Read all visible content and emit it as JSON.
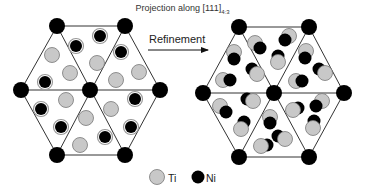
{
  "title": {
    "text": "Projection along [111]",
    "subscript": "4:3"
  },
  "arrow": {
    "label": "Refinement",
    "x1": 148,
    "y1": 50,
    "x2": 208,
    "y2": 50
  },
  "legend": {
    "items": [
      {
        "label": "Ti",
        "type": "Ti",
        "cx": 157,
        "cy": 177,
        "text_x": 168
      },
      {
        "label": "Ni",
        "type": "Ni",
        "cx": 198,
        "cy": 177,
        "text_x": 206
      }
    ]
  },
  "colors": {
    "ti_fill": "#c8c8c8",
    "ti_stroke": "#777777",
    "ni_fill": "#000000",
    "ni_ring": "#999999",
    "line": "#333333",
    "vertex": "#000000"
  },
  "panels": [
    {
      "name": "before-refinement",
      "center": [
        90,
        90
      ],
      "vertices": [
        [
          57,
          26
        ],
        [
          125,
          26
        ],
        [
          160,
          90
        ],
        [
          125,
          155
        ],
        [
          57,
          155
        ],
        [
          21,
          90
        ]
      ],
      "atoms": [
        {
          "type": "Ni",
          "x": 100,
          "y": 36
        },
        {
          "type": "Ni",
          "x": 76,
          "y": 46
        },
        {
          "type": "Ti",
          "x": 52,
          "y": 55
        },
        {
          "type": "Ni",
          "x": 121,
          "y": 52
        },
        {
          "type": "Ti",
          "x": 97,
          "y": 63
        },
        {
          "type": "Ti",
          "x": 70,
          "y": 73
        },
        {
          "type": "Ti",
          "x": 139,
          "y": 72
        },
        {
          "type": "Ti",
          "x": 116,
          "y": 80
        },
        {
          "type": "Ni",
          "x": 45,
          "y": 82
        },
        {
          "type": "Ni",
          "x": 135,
          "y": 99
        },
        {
          "type": "Ti",
          "x": 66,
          "y": 100
        },
        {
          "type": "Ti",
          "x": 111,
          "y": 109
        },
        {
          "type": "Ni",
          "x": 41,
          "y": 109
        },
        {
          "type": "Ti",
          "x": 86,
          "y": 118
        },
        {
          "type": "Ni",
          "x": 131,
          "y": 127
        },
        {
          "type": "Ni",
          "x": 61,
          "y": 127
        },
        {
          "type": "Ni",
          "x": 105,
          "y": 137
        },
        {
          "type": "Ti",
          "x": 80,
          "y": 145
        }
      ]
    },
    {
      "name": "after-refinement",
      "center": [
        274,
        93
      ],
      "vertices": [
        [
          239,
          27
        ],
        [
          309,
          27
        ],
        [
          344,
          93
        ],
        [
          309,
          157
        ],
        [
          239,
          157
        ],
        [
          203,
          93
        ]
      ],
      "atoms": [
        {
          "type": "Ti",
          "x": 289,
          "y": 36,
          "nx": -4,
          "ny": 4
        },
        {
          "type": "Ti",
          "x": 255,
          "y": 43,
          "nx": 5,
          "ny": 5
        },
        {
          "type": "Ti",
          "x": 234,
          "y": 52,
          "nx": 0,
          "ny": 7
        },
        {
          "type": "Ti",
          "x": 306,
          "y": 51,
          "nx": -1,
          "ny": 7
        },
        {
          "type": "Ti",
          "x": 278,
          "y": 62,
          "nx": 0,
          "ny": -6
        },
        {
          "type": "Ti",
          "x": 257,
          "y": 74,
          "nx": -5,
          "ny": -5
        },
        {
          "type": "Ti",
          "x": 325,
          "y": 73,
          "nx": -6,
          "ny": -4
        },
        {
          "type": "Ti",
          "x": 296,
          "y": 81,
          "nx": 6,
          "ny": 0
        },
        {
          "type": "Ti",
          "x": 223,
          "y": 80,
          "nx": 7,
          "ny": 0
        },
        {
          "type": "Ti",
          "x": 322,
          "y": 101,
          "nx": -6,
          "ny": 5
        },
        {
          "type": "Ti",
          "x": 253,
          "y": 101,
          "nx": -6,
          "ny": -2
        },
        {
          "type": "Ti",
          "x": 293,
          "y": 110,
          "nx": 5,
          "ny": -2
        },
        {
          "type": "Ti",
          "x": 220,
          "y": 106,
          "nx": 6,
          "ny": 6
        },
        {
          "type": "Ti",
          "x": 270,
          "y": 117,
          "nx": 0,
          "ny": 6
        },
        {
          "type": "Ti",
          "x": 313,
          "y": 128,
          "nx": 1,
          "ny": -7
        },
        {
          "type": "Ti",
          "x": 241,
          "y": 129,
          "nx": 3,
          "ny": -7
        },
        {
          "type": "Ti",
          "x": 285,
          "y": 139,
          "nx": -7,
          "ny": -3
        },
        {
          "type": "Ti",
          "x": 261,
          "y": 146,
          "nx": 6,
          "ny": -1
        }
      ]
    }
  ]
}
